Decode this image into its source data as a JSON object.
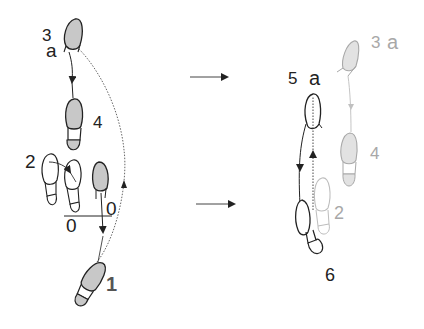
{
  "diagram": {
    "title": "",
    "colors": {
      "background": "#ffffff",
      "ink": "#222222",
      "faded_ink": "#a8a8a8",
      "shaded_foot": "#c8c8c8",
      "faded_shade": "#e2e2e2"
    },
    "left_panel": {
      "labels": {
        "step_3": "3",
        "step_3_count": "a",
        "step_4": "4",
        "step_2": "2",
        "zero_right": "0",
        "zero_left": "0",
        "step_1": "1"
      }
    },
    "transition_arrows": [
      {
        "name": "upper-arrow",
        "direction": "right"
      },
      {
        "name": "lower-arrow",
        "direction": "right"
      }
    ],
    "right_panel": {
      "labels": {
        "step_5": "5",
        "step_5_count": "a",
        "ghost_step_3": "3",
        "ghost_step_3_count": "a",
        "ghost_step_4": "4",
        "ghost_step_2": "2",
        "step_6": "6"
      }
    }
  }
}
